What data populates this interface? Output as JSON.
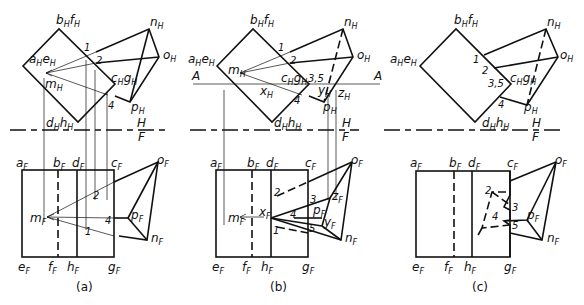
{
  "figure": {
    "panels": [
      {
        "caption": "(a)",
        "top_labels": {
          "bf": "b",
          "bf_sub": "H",
          "bf2": "f",
          "bf2_sub": "H",
          "ae": "a",
          "ae_sub": "H",
          "ae2": "e",
          "ae2_sub": "H",
          "n": "n",
          "n_sub": "H",
          "o": "o",
          "o_sub": "H",
          "m": "m",
          "m_sub": "H",
          "cg": "c",
          "cg_sub": "H",
          "cg2": "g",
          "cg2_sub": "H",
          "p": "p",
          "p_sub": "H",
          "dh": "d",
          "dh_sub": "H",
          "dh2": "h",
          "dh2_sub": "H",
          "n1": "1",
          "n2": "2",
          "n4": "4"
        },
        "bottom_labels": {
          "a": "a",
          "b": "b",
          "d": "d",
          "c": "c",
          "o": "o",
          "m": "m",
          "p": "p",
          "n": "n",
          "e": "e",
          "f": "f",
          "h": "h",
          "g": "g",
          "sub": "F",
          "n1": "1",
          "n2": "2",
          "n4": "4"
        },
        "fold_line": {
          "upper": "H",
          "lower": "F"
        }
      },
      {
        "caption": "(b)",
        "top_labels": {
          "bf": "b",
          "bf2": "f",
          "ae": "a",
          "ae2": "e",
          "n": "n",
          "o": "o",
          "m": "m",
          "cg": "c",
          "cg2": "g",
          "p": "p",
          "dh": "d",
          "dh2": "h",
          "x": "x",
          "y": "y",
          "z": "z",
          "sub": "H",
          "n1": "1",
          "n2": "2",
          "n35": "3,5",
          "n4": "4",
          "cut_left": "A",
          "cut_right": "A"
        },
        "bottom_labels": {
          "a": "a",
          "b": "b",
          "d": "d",
          "c": "c",
          "o": "o",
          "m": "m",
          "x": "x",
          "z": "z",
          "p": "p",
          "y": "y",
          "n": "n",
          "e": "e",
          "f": "f",
          "h": "h",
          "g": "g",
          "sub": "F",
          "n1": "1",
          "n2": "2",
          "n3": "3",
          "n4": "4",
          "n5": "5"
        },
        "fold_line": {
          "upper": "H",
          "lower": "F"
        }
      },
      {
        "caption": "(c)",
        "top_labels": {
          "bf": "b",
          "bf2": "f",
          "ae": "a",
          "ae2": "e",
          "n": "n",
          "o": "o",
          "cg": "c",
          "cg2": "g",
          "p": "p",
          "dh": "d",
          "dh2": "h",
          "sub": "H",
          "n1": "1",
          "n2": "2",
          "n35": "3,5",
          "n4": "4"
        },
        "bottom_labels": {
          "a": "a",
          "b": "b",
          "d": "d",
          "c": "c",
          "o": "o",
          "p": "p",
          "n": "n",
          "e": "e",
          "f": "f",
          "h": "h",
          "g": "g",
          "sub": "F",
          "n2": "2",
          "n3": "3",
          "n4": "4",
          "n5": "5"
        },
        "fold_line": {
          "upper": "H",
          "lower": "F"
        }
      }
    ]
  }
}
